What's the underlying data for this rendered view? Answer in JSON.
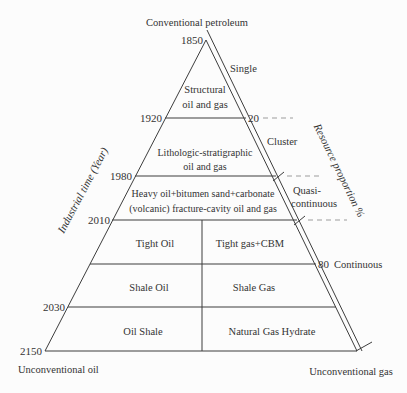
{
  "diagram": {
    "title_top": "Conventional petroleum",
    "footer": {
      "left": "Unconventional oil",
      "right": "Unconventional gas"
    },
    "axes": {
      "left_title": "Industrial time (Year)",
      "right_title": "Resource proportion %",
      "years": [
        "1850",
        "1920",
        "1980",
        "2010",
        "2030",
        "2150"
      ],
      "proportions": [
        "20",
        "80"
      ]
    },
    "stages": {
      "single": "Single",
      "cluster": "Cluster",
      "quasi_line1": "Quasi-",
      "quasi_line2": "continuous",
      "continuous": "Continuous"
    },
    "layers": {
      "structural_line1": "Structural",
      "structural_line2": "oil and gas",
      "lithologic_line1": "Lithologic-stratigraphic",
      "lithologic_line2": "oil and gas",
      "heavy_line1": "Heavy oil+bitumen sand+carbonate",
      "heavy_line2": "(volcanic) fracture-cavity oil and gas",
      "tight_oil": "Tight Oil",
      "tight_gas": "Tight gas+CBM",
      "shale_oil": "Shale Oil",
      "shale_gas": "Shale Gas",
      "oil_shale": "Oil Shale",
      "gas_hydrate": "Natural Gas Hydrate"
    },
    "colors": {
      "background": "#fcfcfc",
      "line": "#3d3d3d",
      "dash": "#9c9c9c",
      "text": "#333333"
    }
  }
}
